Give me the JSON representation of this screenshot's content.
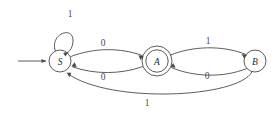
{
  "figure": {
    "kind": "finite-state-machine-diagram",
    "background_color": "#ffffff",
    "stroke_color": "#4a4a4a",
    "text_color": "#2b2b2b",
    "width": 278,
    "height": 114
  },
  "states": [
    {
      "id": "S",
      "label": "S",
      "shape": "circle",
      "accepting": false,
      "start": true,
      "cx": 60,
      "cy": 61,
      "r": 11
    },
    {
      "id": "A",
      "label": "A",
      "shape": "double-circle",
      "accepting": true,
      "start": false,
      "cx": 157,
      "cy": 61,
      "r": 15,
      "r_inner": 11
    },
    {
      "id": "B",
      "label": "B",
      "shape": "circle",
      "accepting": false,
      "start": false,
      "cx": 255,
      "cy": 61,
      "r": 11
    }
  ],
  "transitions": [
    {
      "from": "S",
      "to": "S",
      "label": "1",
      "kind": "self-loop",
      "label_x": 70,
      "label_y": 14
    },
    {
      "from": "S",
      "to": "A",
      "label": "0",
      "kind": "arc-up",
      "label_x": 103,
      "label_y": 43
    },
    {
      "from": "A",
      "to": "S",
      "label": "0",
      "kind": "arc-down",
      "label_x": 103,
      "label_y": 77
    },
    {
      "from": "A",
      "to": "B",
      "label": "1",
      "kind": "arc-up",
      "label_x": 208,
      "label_y": 41
    },
    {
      "from": "B",
      "to": "A",
      "label": "0",
      "kind": "arc-down",
      "label_x": 207,
      "label_y": 76
    },
    {
      "from": "B",
      "to": "S",
      "label": "1",
      "kind": "arc-long-down",
      "label_x": 147,
      "label_y": 103
    }
  ],
  "start_arrow": {
    "name": "start-arrow",
    "from_x": 18,
    "from_y": 61,
    "to_x": 48,
    "to_y": 61
  }
}
